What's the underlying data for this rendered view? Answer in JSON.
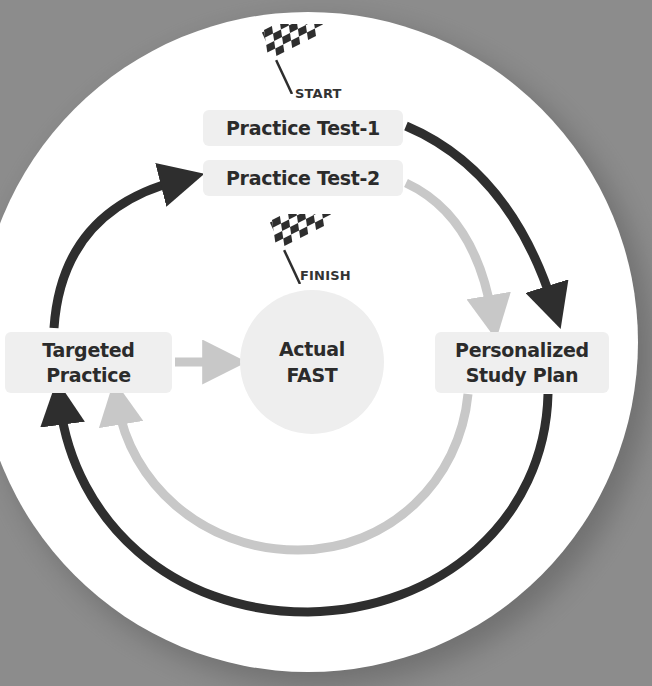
{
  "diagram": {
    "start_label": "START",
    "finish_label": "FINISH",
    "nodes": {
      "practice_test_1": "Practice Test-1",
      "practice_test_2": "Practice Test-2",
      "targeted_practice": {
        "line1": "Targeted",
        "line2": "Practice"
      },
      "personalized_study_plan": {
        "line1": "Personalized",
        "line2": "Study Plan"
      },
      "actual_fast": {
        "line1": "Actual",
        "line2": "FAST"
      }
    },
    "edges": [
      {
        "from": "Practice Test-1",
        "to": "Personalized Study Plan",
        "style": "dark"
      },
      {
        "from": "Personalized Study Plan",
        "to": "Targeted Practice",
        "style": "dark"
      },
      {
        "from": "Targeted Practice",
        "to": "Practice Test-2",
        "style": "dark"
      },
      {
        "from": "Practice Test-2",
        "to": "Personalized Study Plan",
        "style": "light"
      },
      {
        "from": "Personalized Study Plan",
        "to": "Targeted Practice",
        "style": "light"
      },
      {
        "from": "Targeted Practice",
        "to": "Actual FAST",
        "style": "light"
      }
    ],
    "icons": {
      "start": "checkered-flag-icon",
      "finish": "checkered-flag-icon"
    },
    "colors": {
      "background": "#8c8c8c",
      "circle": "#ffffff",
      "box": "#efefef",
      "dark_arrow": "#2e2e2e",
      "light_arrow": "#c8c8c8",
      "text": "#2b2b2b"
    }
  }
}
